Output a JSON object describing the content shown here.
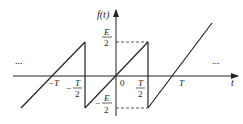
{
  "diagram": {
    "y_axis_label": "f(t)",
    "x_axis_label": "t",
    "origin_label": "0",
    "ellipsis_left": "...",
    "ellipsis_right": "...",
    "labels": {
      "E_num": "E",
      "E_den": "2",
      "negE_sign": "−",
      "negE_num": "E",
      "negE_den": "2",
      "negT": "−T",
      "negThalf_sign": "−",
      "negThalf_num": "T",
      "negThalf_den": "2",
      "Thalf_num": "T",
      "Thalf_den": "2",
      "T": "T"
    },
    "colors": {
      "line": "#222222",
      "dash": "#444444"
    }
  }
}
